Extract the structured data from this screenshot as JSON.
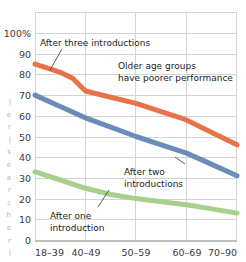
{
  "chart_data": {
    "type": "line",
    "title": "",
    "xlabel": "",
    "ylabel": "",
    "categories": [
      "18–39",
      "40–49",
      "50–59",
      "60–69",
      "70–90"
    ],
    "ylim": [
      0,
      100
    ],
    "yticks": [
      0,
      10,
      20,
      30,
      40,
      50,
      60,
      70,
      80,
      90,
      100
    ],
    "ytick_labels": [
      "0",
      "10",
      "20",
      "30",
      "40",
      "50",
      "60",
      "70",
      "80",
      "90",
      "100%"
    ],
    "grid": true,
    "grid_axis": "both",
    "legend": "none",
    "series": [
      {
        "name": "After three introductions",
        "color": "#e8734a",
        "values": [
          85,
          72,
          66,
          58,
          46
        ],
        "dense_x": [
          0,
          0.25,
          0.5,
          0.75,
          1,
          1.5,
          2,
          2.5,
          3,
          3.5,
          4
        ],
        "dense_y": [
          85,
          83,
          81,
          78,
          72,
          69,
          66,
          62,
          58,
          52,
          46
        ]
      },
      {
        "name": "After two introductions",
        "color": "#6b8cb8",
        "values": [
          70,
          59,
          50,
          42,
          31
        ],
        "dense_x": [
          0,
          0.5,
          1,
          1.5,
          2,
          2.5,
          3,
          3.5,
          4
        ],
        "dense_y": [
          70,
          64.5,
          59,
          54.5,
          50,
          46,
          42,
          36.5,
          31
        ]
      },
      {
        "name": "After one introduction",
        "color": "#a8d08d",
        "values": [
          33,
          25,
          20,
          17,
          13
        ],
        "dense_x": [
          0,
          0.5,
          1,
          1.5,
          2,
          2.5,
          3,
          3.5,
          4
        ],
        "dense_y": [
          33,
          29,
          25,
          22,
          20,
          18.5,
          17,
          15,
          13
        ]
      }
    ],
    "annotations": [
      {
        "id": "anno-three",
        "lines": [
          "After three introductions"
        ],
        "target_series": "After three introductions"
      },
      {
        "id": "anno-older",
        "lines": [
          "Older age groups",
          "have poorer performance"
        ],
        "target_series": ""
      },
      {
        "id": "anno-two",
        "lines": [
          "After two",
          "introductions"
        ],
        "target_series": "After two introductions"
      },
      {
        "id": "anno-one",
        "lines": [
          "After one",
          "introduction"
        ],
        "target_series": "After one introduction"
      }
    ]
  },
  "axis": {
    "y_labels": {
      "t100": "100%",
      "t90": "90",
      "t80": "80",
      "t70": "70",
      "t60": "60",
      "t50": "50",
      "t40": "40",
      "t30": "30",
      "t20": "20",
      "t10": "10",
      "t0": "0"
    },
    "x_labels": {
      "c0": "18–39",
      "c1": "40–49",
      "c2": "50–59",
      "c3": "60–69",
      "c4": "70–90"
    }
  },
  "annotations": {
    "three_line1": "After three introductions",
    "older_line1": "Older age groups",
    "older_line2": "have poorer performance",
    "two_line1": "After two",
    "two_line2": "introductions",
    "one_line1": "After one",
    "one_line2": "introduction"
  },
  "edge_fragments": {
    "f0": "|",
    "f1": "e",
    "f2": "r",
    "f3": "|",
    "f4": "s",
    "f5": "e",
    "f6": "a",
    "f7": "r",
    "f8": "c",
    "f9": "h",
    "f10": "e",
    "f11": "r",
    "f12": "|"
  },
  "colors": {
    "series_three": "#e8734a",
    "series_two": "#6b8cb8",
    "series_one": "#a8d08d",
    "grid": "#d4d4d4",
    "axis_text": "#3a3a3a",
    "annotation_text": "#1d1d1d",
    "background": "#ffffff"
  }
}
